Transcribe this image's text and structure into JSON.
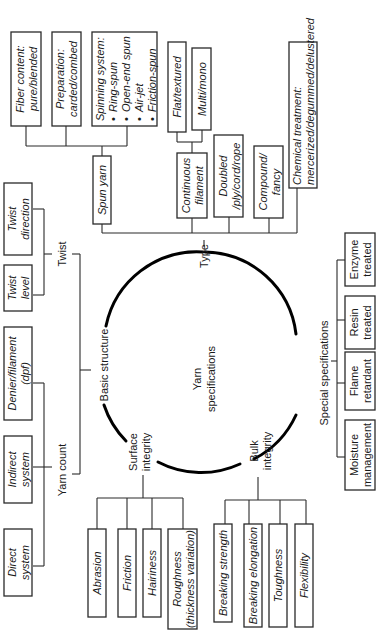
{
  "diagram": {
    "title": "Yarn specifications",
    "orientation": "rotated 90° counter-clockwise",
    "center": {
      "line1": "Yarn",
      "line2": "specifications"
    },
    "categories": {
      "type": "Type",
      "basic_structure": "Basic structure",
      "surface_integrity": {
        "line1": "Surface",
        "line2": "integrity"
      },
      "bulk_integrity": {
        "line1": "Bulk",
        "line2": "integrity"
      },
      "special_specifications": "Special specifications"
    },
    "type_branch": {
      "spun_yarn": "Spun yarn",
      "spun_children": {
        "fiber_content": {
          "line1": "Fiber content:",
          "line2": "pure/blended"
        },
        "preparation": {
          "line1": "Preparation:",
          "line2": "carded/combed"
        },
        "spinning_system": {
          "title": "Spinning system:",
          "items": [
            "Ring-spun",
            "Open-end spun",
            "Air-jet",
            "Friction-spun"
          ]
        }
      },
      "continuous_filament": {
        "line1": "Continuous",
        "line2": "filament"
      },
      "filament_children": {
        "flat_textured": "Flat/textured",
        "multi_mono": "Multi/mono"
      },
      "doubled": {
        "line1": "Doubled",
        "line2": "/ply/cord/rope"
      },
      "compound": {
        "line1": "Compound/",
        "line2": "fancy"
      },
      "chemical_treatment": {
        "line1": "Chemical treatment:",
        "line2": "mercerized/degummed/delustered"
      }
    },
    "basic_structure_branch": {
      "twist": "Twist",
      "twist_children": {
        "twist_direction": {
          "line1": "Twist",
          "line2": "direction"
        },
        "twist_level": {
          "line1": "Twist",
          "line2": "level"
        }
      },
      "yarn_count": "Yarn count",
      "yarn_count_children": {
        "denier": {
          "line1": "Denier/filament",
          "line2": "(dpf)"
        },
        "indirect": {
          "line1": "Indirect",
          "line2": "system"
        },
        "direct": {
          "line1": "Direct",
          "line2": "system"
        }
      }
    },
    "surface_branch": {
      "abrasion": "Abrasion",
      "friction": "Friction",
      "hairiness": "Hairiness",
      "roughness": {
        "line1": "Roughness",
        "line2": "(thickness variation)"
      }
    },
    "bulk_branch": {
      "breaking_strength": "Breaking strength",
      "breaking_elongation": "Breaking elongation",
      "toughness": "Toughness",
      "flexibility": "Flexibility"
    },
    "special_branch": {
      "enzyme": {
        "line1": "Enzyme",
        "line2": "treated"
      },
      "resin": {
        "line1": "Resin",
        "line2": "treated"
      },
      "flame": {
        "line1": "Flame",
        "line2": "retardant"
      },
      "moisture": {
        "line1": "Moisture",
        "line2": "management"
      }
    },
    "colors": {
      "line": "#2a2a2a",
      "arc": "#000000",
      "background": "#ffffff"
    }
  }
}
